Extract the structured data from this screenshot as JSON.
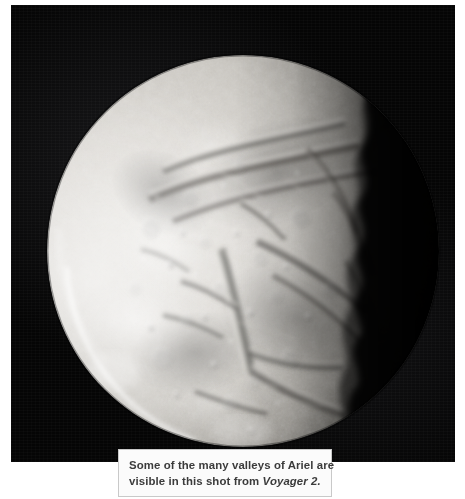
{
  "figure": {
    "subject": "Ariel",
    "photo_alt": "Ariel",
    "background_color": "#050505",
    "page_background": "#ffffff"
  },
  "caption": {
    "line1": "Some of the many valleys of Ariel are",
    "line2_prefix": "visible in this shot from ",
    "line2_source": "Voyager 2.",
    "text_color": "#3b3b3b",
    "box_background": "#fbfbfb",
    "box_border_color": "#c9c9c9"
  },
  "moon": {
    "name": "Ariel",
    "phase": "gibbous",
    "illumination_direction": "left",
    "surface_color_bright": "#e6e4e0",
    "surface_color_mid": "#b8b5b0",
    "surface_color_shadow": "#3a3936"
  }
}
